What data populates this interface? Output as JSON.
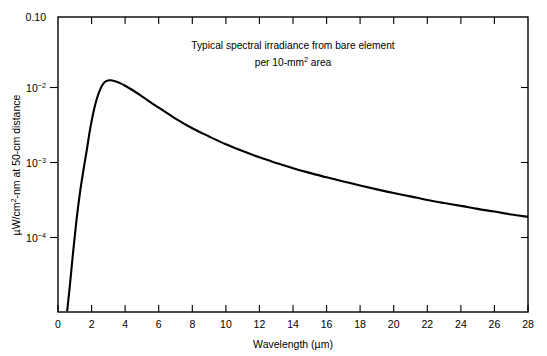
{
  "chart_data": {
    "type": "line",
    "title_line1": "Typical spectral irradiance from bare element",
    "title_line2_prefix": "per 10-mm",
    "title_line2_sup": "2",
    "title_line2_suffix": " area",
    "xlabel_text": "Wavelength (µm)",
    "ylabel_prefix": "µW/cm",
    "ylabel_sup": "2",
    "ylabel_suffix": "-nm at 50-cm distance",
    "ylabel_full": "µW/cm²-nm at 50-cm distance",
    "xscale": "linear",
    "yscale": "log",
    "xlim": [
      0,
      28
    ],
    "ylim": [
      1e-05,
      0.1
    ],
    "grid": false,
    "legend": false,
    "x_ticks": [
      0,
      2,
      4,
      6,
      8,
      10,
      12,
      14,
      16,
      18,
      20,
      22,
      24,
      26,
      28
    ],
    "x_tick_labels": [
      "0",
      "2",
      "4",
      "6",
      "8",
      "10",
      "12",
      "14",
      "16",
      "18",
      "20",
      "22",
      "24",
      "26",
      "28"
    ],
    "y_ticks": [
      0.1,
      0.01,
      0.001,
      0.0001
    ],
    "y_tick_labels": [
      {
        "mantissa": "0.10",
        "exponent": ""
      },
      {
        "mantissa": "10",
        "exponent": "−2"
      },
      {
        "mantissa": "10",
        "exponent": "−3"
      },
      {
        "mantissa": "10",
        "exponent": "−4"
      }
    ],
    "series": [
      {
        "name": "Spectral irradiance",
        "color": "#000000",
        "x": [
          0.55,
          0.7,
          0.9,
          1.1,
          1.3,
          1.5,
          1.7,
          1.9,
          2.1,
          2.3,
          2.5,
          2.7,
          2.9,
          3.1,
          3.4,
          3.7,
          4.0,
          4.5,
          5.0,
          5.5,
          6.0,
          7.0,
          8.0,
          9.0,
          10.0,
          11.0,
          12.0,
          13.0,
          14.0,
          15.0,
          16.0,
          17.0,
          18.0,
          19.0,
          20.0,
          21.0,
          22.0,
          23.0,
          24.0,
          25.0,
          26.0,
          27.0,
          28.0
        ],
        "y": [
          1.05e-05,
          2.2e-05,
          6.5e-05,
          0.000175,
          0.0004,
          0.0008,
          0.0015,
          0.0029,
          0.005,
          0.0076,
          0.0103,
          0.0125,
          0.0136,
          0.0139,
          0.0135,
          0.0127,
          0.0117,
          0.01,
          0.0084,
          0.007,
          0.0059,
          0.0042,
          0.0031,
          0.0024,
          0.00188,
          0.00152,
          0.00125,
          0.00105,
          0.00089,
          0.00077,
          0.00067,
          0.00059,
          0.00052,
          0.00046,
          0.00041,
          0.00037,
          0.00033,
          0.0003,
          0.000275,
          0.00025,
          0.00023,
          0.00021,
          0.000195
        ]
      }
    ],
    "peak": {
      "x": 3.1,
      "y": 0.0139
    }
  }
}
